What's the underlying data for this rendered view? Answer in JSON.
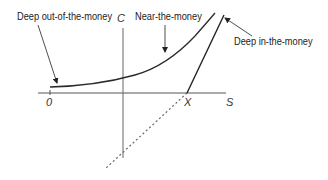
{
  "diagram": {
    "type": "option-value-vs-stock-price",
    "axes": {
      "vertical_label": "C",
      "horizontal_label": "S",
      "origin_label": "0",
      "strike_label": "X"
    },
    "annotations": {
      "deep_otm": "Deep out-of-the-money",
      "near_money": "Near-the-money",
      "deep_itm": "Deep in-the-money"
    },
    "colors": {
      "curve": "#2a2a2a",
      "axis": "#555555",
      "intrinsic_line": "#222222",
      "dashed_line": "#666666",
      "text": "#222222"
    }
  }
}
